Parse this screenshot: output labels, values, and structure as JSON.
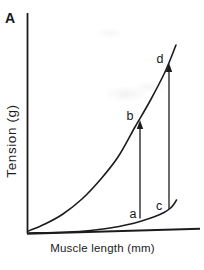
{
  "figure": {
    "panel_label": "A",
    "ink_color": "#1c1c1c",
    "background": "#ffffff"
  },
  "chart_data": {
    "type": "line",
    "title": "",
    "xlabel": "Muscle length (mm)",
    "ylabel": "Tension (g)",
    "axes": {
      "ticks": "none",
      "note": "schematic axes without numeric tick labels",
      "y_axis_px": {
        "x": 27.5,
        "y_top": 13,
        "y_bottom": 233.5
      },
      "x_axis_px": {
        "x1": 27,
        "y1": 233.8,
        "x2": 200,
        "y2": 228.8
      }
    },
    "series": [
      {
        "name": "upper-curve",
        "points_px": [
          [
            28.5,
            231
          ],
          [
            45,
            224
          ],
          [
            63,
            214
          ],
          [
            82,
            199
          ],
          [
            100,
            180
          ],
          [
            118,
            157
          ],
          [
            135,
            127
          ],
          [
            150,
            101
          ],
          [
            165,
            72
          ],
          [
            176,
            45
          ]
        ]
      },
      {
        "name": "lower-curve",
        "points_px": [
          [
            29,
            233
          ],
          [
            55,
            232.5
          ],
          [
            85,
            231
          ],
          [
            110,
            228
          ],
          [
            128,
            224.5
          ],
          [
            143,
            220.5
          ],
          [
            155,
            216.5
          ],
          [
            164,
            212.5
          ],
          [
            170,
            208.5
          ],
          [
            174,
            204
          ],
          [
            176.5,
            200
          ]
        ]
      }
    ],
    "arrows": [
      {
        "name": "arrow-a-to-b",
        "x": 140,
        "y_from": 218.5,
        "y_to": 120
      },
      {
        "name": "arrow-c-to-d",
        "x": 169,
        "y_from": 209,
        "y_to": 63
      }
    ],
    "point_labels": [
      {
        "text": "a",
        "x": 133,
        "y": 214
      },
      {
        "text": "b",
        "x": 130,
        "y": 116
      },
      {
        "text": "c",
        "x": 159,
        "y": 205.5
      },
      {
        "text": "d",
        "x": 160,
        "y": 59
      }
    ],
    "legend": "none"
  }
}
